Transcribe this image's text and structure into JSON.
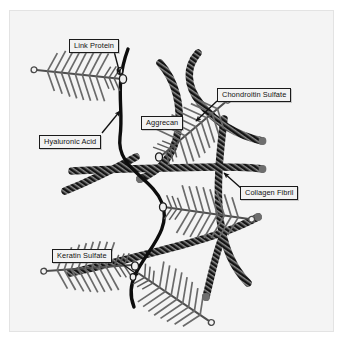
{
  "figure": {
    "type": "scientific-diagram",
    "background_color": "#f4f4f4",
    "page_color": "#ffffff",
    "border_color": "#e3e3e3"
  },
  "labels": {
    "link_protein": "Link Protein",
    "chondroitin_sulfate": "Chondroitin Sulfate",
    "aggrecan": "Aggrecan",
    "hyaluronic_acid": "Hyaluronic Acid",
    "collagen_fibril": "Collagen Fibril",
    "keratin_sulfate": "Keratin Sulfate"
  },
  "colors": {
    "collagen_fibril": "#1c1c1c",
    "collagen_fibril_cap": "#6e6e6e",
    "hyaluronan_backbone": "#0d0d0d",
    "aggrecan_core": "#555555",
    "glycosaminoglycan_bristle": "#6a6a6a",
    "label_text": "#111111",
    "label_border": "#1a1a1a",
    "label_fill": "#f2f2f2",
    "arrow": "#111111"
  },
  "elements": {
    "collagen_fibrils_count": 7,
    "aggrecan_monomers_count": 5,
    "link_protein_nodes_count": 5,
    "hyaluronan_strands_count": 1,
    "fibril_texture": "cross-hatched banded rope",
    "aggrecan_shape": "bottlebrush with open circle at distal tip"
  },
  "callouts": [
    {
      "name": "link-protein",
      "text": "Link Protein",
      "arrow": "down"
    },
    {
      "name": "chondroitin-sulfate",
      "text": "Chondroitin Sulfate",
      "arrow": "down-left"
    },
    {
      "name": "aggrecan",
      "text": "Aggrecan",
      "arrow": "none"
    },
    {
      "name": "hyaluronic-acid",
      "text": "Hyaluronic Acid",
      "arrow": "up-right"
    },
    {
      "name": "collagen-fibril",
      "text": "Collagen Fibril",
      "arrow": "up-left"
    },
    {
      "name": "keratin-sulfate",
      "text": "Keratin Sulfate",
      "arrow": "down-right"
    }
  ]
}
